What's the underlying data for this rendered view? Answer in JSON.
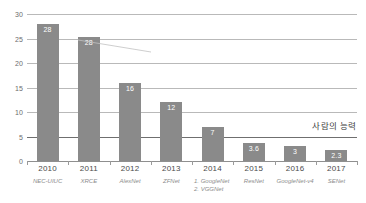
{
  "chart_data": {
    "type": "bar",
    "title": "",
    "xlabel": "",
    "ylabel": "",
    "ylim": [
      0,
      30
    ],
    "yticks": [
      0,
      5,
      10,
      15,
      20,
      25,
      30
    ],
    "ytick_labels": [
      "0",
      "5",
      "10",
      "15",
      "20",
      "25",
      "30"
    ],
    "grid": true,
    "legend": "none",
    "categories": [
      "2010",
      "2011",
      "2012",
      "2013",
      "2014",
      "2015",
      "2016",
      "2017"
    ],
    "category_sublabels": [
      [
        "NEC-UIUC"
      ],
      [
        "XRCE"
      ],
      [
        "AlexNet"
      ],
      [
        "ZFNet"
      ],
      [
        "1. GoogleNet",
        "2. VGGNet"
      ],
      [
        "ResNet"
      ],
      [
        "GoogleNet-v4"
      ],
      [
        "SENet"
      ]
    ],
    "values": [
      28,
      28,
      16,
      12,
      7,
      3.6,
      3,
      2.3
    ],
    "value_labels": [
      "28",
      "28",
      "16",
      "12",
      "7",
      "3.6",
      "3",
      "2.3"
    ],
    "bar_draw_heights": [
      27.9,
      25.4,
      16,
      12,
      7,
      3.6,
      3,
      2.3
    ],
    "annotations": [
      {
        "name": "human-performance-line",
        "text": "사람의 능력",
        "y_value": 5
      }
    ],
    "colors": {
      "bar": "#8a8a8a",
      "value_label": "#ffffff",
      "gridline": "#b9b9b9",
      "human_line": "#6f6f6f",
      "axis": "#8f8f8f",
      "year_label": "#4a4a4a",
      "model_label": "#8d8d8d",
      "background": "#ffffff"
    }
  }
}
